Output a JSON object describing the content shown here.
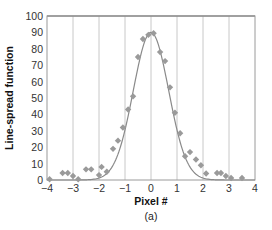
{
  "chart_data": {
    "type": "scatter",
    "title": "",
    "xlabel": "Pixel #",
    "ylabel": "Line-spread function",
    "caption": "(a)",
    "xlim": [
      -4,
      4
    ],
    "ylim": [
      0,
      100
    ],
    "xticks": [
      -4,
      -3,
      -2,
      -1,
      0,
      1,
      2,
      3,
      4
    ],
    "yticks": [
      0,
      10,
      20,
      30,
      40,
      50,
      60,
      70,
      80,
      90,
      100
    ],
    "grid": "vertical",
    "colors": {
      "points": "#9a9a9a",
      "curve": "#8a8a8a",
      "grid": "#c8c8c8"
    },
    "series": [
      {
        "name": "measured",
        "kind": "scatter",
        "marker": "diamond",
        "points": [
          [
            -3.9,
            0.5
          ],
          [
            -3.4,
            4.3
          ],
          [
            -3.2,
            4.3
          ],
          [
            -3.0,
            2.4
          ],
          [
            -2.8,
            0.5
          ],
          [
            -2.5,
            6.5
          ],
          [
            -2.3,
            6.5
          ],
          [
            -2.0,
            3.0
          ],
          [
            -1.9,
            8.0
          ],
          [
            -1.7,
            5.0
          ],
          [
            -1.46,
            19
          ],
          [
            -1.27,
            24
          ],
          [
            -1.08,
            32
          ],
          [
            -0.88,
            43
          ],
          [
            -0.69,
            51
          ],
          [
            -0.5,
            75
          ],
          [
            -0.31,
            86
          ],
          [
            -0.1,
            88.5
          ],
          [
            0.1,
            89.5
          ],
          [
            0.35,
            78
          ],
          [
            0.54,
            72.5
          ],
          [
            0.73,
            56.5
          ],
          [
            0.92,
            41
          ],
          [
            1.12,
            28.5
          ],
          [
            1.31,
            14.5
          ],
          [
            1.5,
            17
          ],
          [
            1.73,
            12.5
          ],
          [
            1.92,
            9
          ],
          [
            2.12,
            4
          ],
          [
            2.54,
            4.3
          ],
          [
            2.69,
            4.3
          ],
          [
            2.88,
            2.4
          ],
          [
            3.08,
            1.2
          ],
          [
            3.5,
            1.2
          ]
        ]
      },
      {
        "name": "fit",
        "kind": "line",
        "model": "gaussian",
        "amplitude": 90,
        "center": 0.0,
        "sigma": 0.68,
        "x_range": [
          -4,
          4
        ]
      }
    ]
  }
}
